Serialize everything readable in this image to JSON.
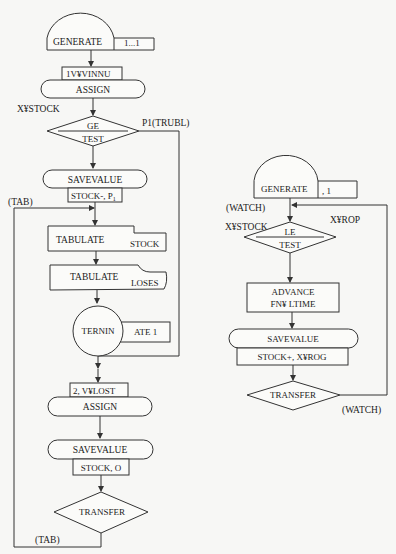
{
  "diagram": {
    "type": "GPSS block diagram",
    "left_flow": {
      "generate": {
        "label": "GENERATE",
        "operand": "1...1"
      },
      "assign_1": {
        "operand": "1V¥VINNU",
        "label": "ASSIGN"
      },
      "test_ge": {
        "operand_left": "X¥STOCK",
        "label_top": "GE",
        "label_bottom": "TEST",
        "branch": "P1(TRUBL)"
      },
      "savevalue_1": {
        "label": "SAVEVALUE",
        "operand": "STOCK-, P",
        "operand_sub": "1"
      },
      "tab_entry": {
        "label": "(TAB)"
      },
      "tabulate_stock": {
        "label": "TABULATE",
        "operand": "STOCK"
      },
      "tabulate_loses": {
        "label": "TABULATE",
        "operand": "LOSES"
      },
      "terminate": {
        "label": "TERNIN",
        "operand": "ATE 1"
      },
      "assign_2": {
        "operand": "2, V¥LOST",
        "label": "ASSIGN"
      },
      "savevalue_2": {
        "label": "SAVEVALUE",
        "operand": "STOCK, O"
      },
      "transfer": {
        "label": "TRANSFER",
        "target": "(TAB)"
      }
    },
    "right_flow": {
      "generate": {
        "label": "GENERATE",
        "operand": ", 1"
      },
      "watch_entry": {
        "label": "(WATCH)"
      },
      "test_le": {
        "operand_left": "X¥STOCK",
        "label_top": "LE",
        "label_bottom": "TEST",
        "operand_right": "X¥ROP"
      },
      "advance": {
        "label": "ADVANCE",
        "operand": "FN¥ LTIME"
      },
      "savevalue": {
        "label": "SAVEVALUE",
        "operand": "STOCK+, X¥ROG"
      },
      "transfer": {
        "label": "TRANSFER",
        "target": "(WATCH)"
      }
    },
    "colors": {
      "line": "#333333",
      "background": "#f7f7f5",
      "text": "#222222"
    }
  }
}
